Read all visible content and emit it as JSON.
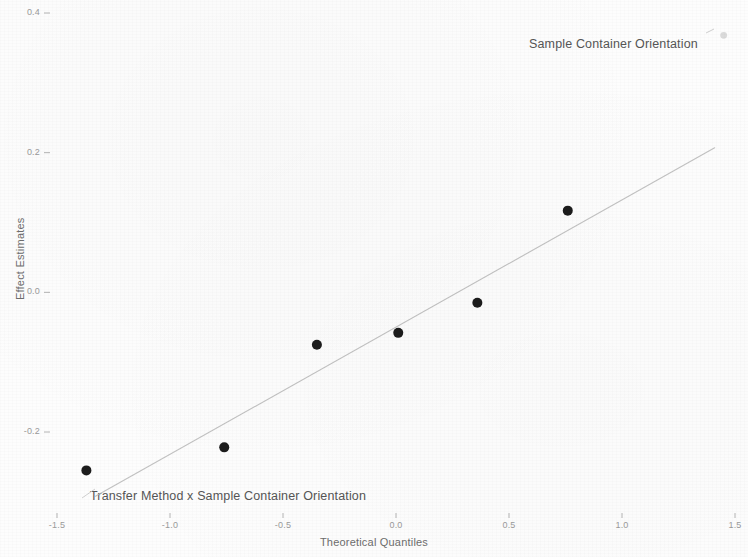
{
  "chart_data": {
    "type": "scatter",
    "title": "",
    "xlabel": "Theoretical Quantiles",
    "ylabel": "Effect Estimates",
    "xlim": [
      -1.6,
      1.6
    ],
    "ylim": [
      -0.3,
      0.42
    ],
    "xticks": [
      -1.5,
      -1.0,
      -0.5,
      0.0,
      0.5,
      1.0,
      1.5
    ],
    "xticklabels": [
      "-1.5",
      "-1.0",
      "-0.5",
      "0.0",
      "0.5",
      "1.0",
      "1.5"
    ],
    "yticks": [
      0.4,
      0.2,
      0.0,
      -0.2
    ],
    "yticklabels": [
      "0.4",
      "0.2",
      "0.0",
      "-0.2"
    ],
    "grid": false,
    "legend": "none",
    "series": [
      {
        "name": "effects",
        "marker": "filled-circle",
        "color": "#1c1c1c",
        "points": [
          {
            "x": -1.37,
            "y": -0.255
          },
          {
            "x": -0.76,
            "y": -0.222
          },
          {
            "x": -0.35,
            "y": -0.075
          },
          {
            "x": 0.01,
            "y": -0.058
          },
          {
            "x": 0.36,
            "y": -0.015
          },
          {
            "x": 0.76,
            "y": 0.117
          }
        ]
      },
      {
        "name": "faded-outlier",
        "marker": "faint-circle",
        "color": "#bdbdbd",
        "points": [
          {
            "x": 1.45,
            "y": 0.368
          }
        ]
      }
    ],
    "reference_line": {
      "name": "qq-reference-line",
      "color": "#b8b8b8",
      "style": "solid",
      "x1": -1.33,
      "y1": -0.292,
      "x2": 1.41,
      "y2": 0.207
    },
    "annotations": [
      {
        "id": "label-sample-container-orientation",
        "text": "Sample Container Orientation",
        "x": 1.45,
        "y": 0.368,
        "placement": "left-of-point"
      },
      {
        "id": "label-transfer-method-x-sample-container-orientation",
        "text": "Transfer Method x Sample Container Orientation",
        "x": -1.37,
        "y": -0.255,
        "placement": "right-below-point"
      }
    ]
  },
  "axes": {
    "x_title": "Theoretical Quantiles",
    "y_title": "Effect Estimates",
    "x_tick_labels": [
      "-1.5",
      "-1.0",
      "-0.5",
      "0.0",
      "0.5",
      "1.0",
      "1.5"
    ],
    "y_tick_labels": [
      "0.4",
      "0.2",
      "0.0",
      "-0.2"
    ]
  },
  "annotations": {
    "top_right": "Sample Container Orientation",
    "bottom_left": "Transfer Method x Sample Container Orientation"
  },
  "colors": {
    "point": "#1c1c1c",
    "faint_point": "#bdbdbd",
    "line": "#b8b8b8",
    "axis_text": "#9a9a9a",
    "title_text": "#6d6d6d",
    "annotation_text": "#555555",
    "background": "#fdfdfd"
  }
}
